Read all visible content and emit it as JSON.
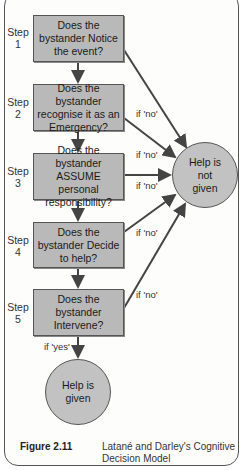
{
  "diagram": {
    "title": "Latané and Darley's Cognitive Decision Model",
    "steps": [
      {
        "step_label": "Step",
        "step_number": "1",
        "question": "Does the bystander Notice the event?"
      },
      {
        "step_label": "Step",
        "step_number": "2",
        "question": "Does the bystander recognise it as an Emergency?"
      },
      {
        "step_label": "Step",
        "step_number": "3",
        "question": "Does the bystander ASSUME personal responsibility?"
      },
      {
        "step_label": "Step",
        "step_number": "4",
        "question": "Does the bystander Decide to help?"
      },
      {
        "step_label": "Step",
        "step_number": "5",
        "question": "Does the bystander Intervene?"
      }
    ],
    "edge_labels": {
      "no": "if 'no'",
      "yes": "if 'yes'"
    },
    "outcomes": {
      "not_given": "Help is not given",
      "given": "Help is given"
    },
    "colors": {
      "box_fill": "#b9b9b9",
      "circle_fill": "#c2c2c2",
      "stroke": "#555555",
      "arrow": "#444444"
    }
  },
  "caption": {
    "figure_number": "Figure 2.11",
    "text": "Latané and Darley's Cognitive Decision Model"
  }
}
